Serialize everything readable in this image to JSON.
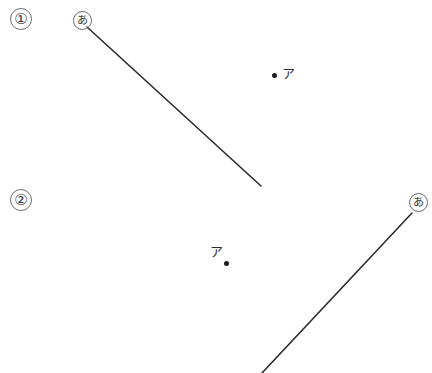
{
  "figure": {
    "width": 432,
    "height": 373,
    "background_color": "#ffffff",
    "stroke_color": "#2b2b30",
    "stroke_width": 1.6,
    "dot_color": "#1b1b20",
    "circle_outline_color": "#6d6d73",
    "problems": [
      {
        "index_label": "①",
        "vertex_label": "あ",
        "point_label": "ア",
        "segment": {
          "x1": 87,
          "y1": 27,
          "x2": 261,
          "y2": 186
        },
        "vertex_circle": {
          "cx": 82.5,
          "cy": 20.5,
          "r": 9.5
        },
        "index_circle": {
          "cx": 21,
          "cy": 19,
          "r": 11
        },
        "point": {
          "x": 274.5,
          "y": 75.5
        }
      },
      {
        "index_label": "②",
        "vertex_label": "あ",
        "point_label": "ア",
        "segment": {
          "x1": 262,
          "y1": 373,
          "x2": 412,
          "y2": 213
        },
        "vertex_circle": {
          "cx": 418.5,
          "cy": 202.5,
          "r": 9.5
        },
        "index_circle": {
          "cx": 21,
          "cy": 200,
          "r": 11
        },
        "point": {
          "x": 226.5,
          "y": 263.5
        }
      }
    ]
  }
}
